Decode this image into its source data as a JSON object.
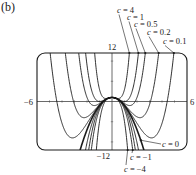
{
  "panel_label": "(b)",
  "chart_data": {
    "type": "line",
    "title": "",
    "function": "f(x) = c x^4 - 2x^2 + 1",
    "xlabel": "",
    "ylabel": "",
    "xlim": [
      -6,
      6
    ],
    "ylim": [
      -12,
      12
    ],
    "grid": false,
    "tick_labels": {
      "x_min": "−6",
      "x_max": "6",
      "y_max": "12",
      "y_min": "−12"
    },
    "series": [
      {
        "name": "c = 4",
        "c": 4,
        "labeled": true
      },
      {
        "name": "c = 1",
        "c": 1,
        "labeled": true
      },
      {
        "name": "c = 0.5",
        "c": 0.5,
        "labeled": true
      },
      {
        "name": "c = 0.2",
        "c": 0.2,
        "labeled": true
      },
      {
        "name": "c = 0.1",
        "c": 0.1,
        "labeled": true
      },
      {
        "name": "c = 0",
        "c": 0,
        "labeled": true,
        "bold": true
      },
      {
        "name": "",
        "c": -0.2,
        "labeled": false
      },
      {
        "name": "",
        "c": -0.5,
        "labeled": false
      },
      {
        "name": "c = −1",
        "c": -1,
        "labeled": true
      },
      {
        "name": "c = −4",
        "c": -4,
        "labeled": true
      }
    ],
    "annotations": [
      {
        "text": "c = 4",
        "text_x": 117,
        "text_y": 13,
        "arrow_to": "top",
        "c": 4
      },
      {
        "text": "c = 1",
        "text_x": 127,
        "text_y": 20,
        "arrow_to": "top",
        "c": 1
      },
      {
        "text": "c = 0.5",
        "text_x": 134,
        "text_y": 27,
        "arrow_to": "top",
        "c": 0.5
      },
      {
        "text": "c = 0.2",
        "text_x": 147,
        "text_y": 35,
        "arrow_to": "top",
        "c": 0.2
      },
      {
        "text": "c = 0.1",
        "text_x": 163,
        "text_y": 44,
        "arrow_to": "top",
        "c": 0.1
      },
      {
        "text": "c = 0",
        "text_x": 162,
        "text_y": 147,
        "arrow_to": "curve",
        "c": 0
      },
      {
        "text": "c = −1",
        "text_x": 130,
        "text_y": 160,
        "arrow_to": "bottom",
        "c": -1
      },
      {
        "text": "c = −4",
        "text_x": 124,
        "text_y": 172,
        "arrow_to": "bottom",
        "c": -4
      }
    ]
  },
  "frame": {
    "left": 37,
    "right": 187,
    "top": 53,
    "bottom": 150,
    "radius": 8
  },
  "colors": {
    "ink": "#1a1a1a",
    "axis": "#444444"
  }
}
